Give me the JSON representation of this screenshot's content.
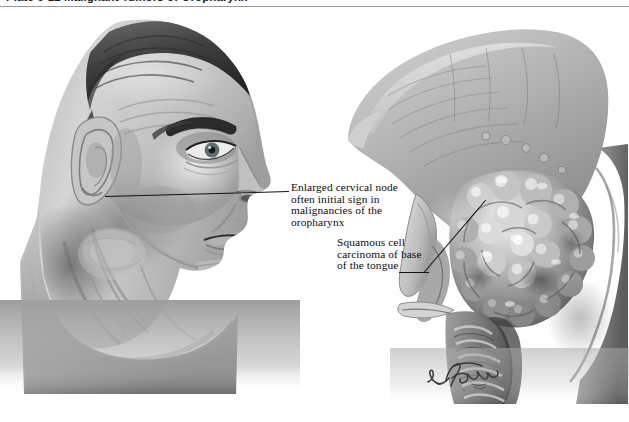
{
  "header": {
    "plate_title": "Plate 6-12  Malignant Tumors of Oropharynx",
    "rule_color": "#9a9a9a"
  },
  "annotations": [
    {
      "id": "enlarged-cervical-node",
      "lines": [
        "Enlarged cervical node",
        "often initial sign in",
        "malignancies of the",
        "oropharynx"
      ],
      "leader": "horizontal-left",
      "points_to": "cervical lymph node in neck"
    },
    {
      "id": "squamous-cell-carcinoma",
      "lines": [
        "Squamous cell",
        "carcinoma of base",
        "of the tongue"
      ],
      "leader": "diagonal-up-right",
      "points_to": "tumor mass at base of tongue"
    }
  ],
  "figures": {
    "left": {
      "name": "lateral-head-profile",
      "description": "Grayscale lateral profile of a man's head and neck showing enlarged cervical lymph node"
    },
    "right": {
      "name": "sagittal-tongue-section",
      "description": "Sagittal section of tongue and oropharynx with cauliflower-like squamous cell carcinoma at base of tongue"
    }
  },
  "signature": {
    "name": "netter-signature",
    "text": "F. Netter"
  },
  "colors": {
    "background": "#ffffff",
    "ink": "#111111",
    "rule": "#9a9a9a",
    "tone_dark": "#4a4a4a",
    "tone_mid": "#8d8d8d",
    "tone_light": "#c9c9c9"
  }
}
